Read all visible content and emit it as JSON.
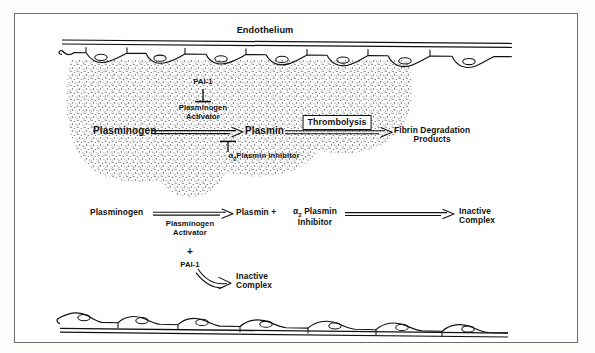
{
  "figure": {
    "domain_title": "Fibrinolysis and thrombolysis schematic",
    "frame_color": "#6d6d6d",
    "ink_color": "#111111",
    "clot_stipple_color": "#2b2b2b"
  },
  "vessel": {
    "top_label": "Endothelium",
    "top_cell_count": 7,
    "bottom_cell_count": 7
  },
  "clot_pathway": {
    "inhibitor_top": "PAI-1",
    "activator_line1": "Plasminogen",
    "activator_line2": "Activator",
    "substrate": "Plasminogen",
    "enzyme": "Plasmin",
    "inhibitor_bottom_alpha": "α",
    "inhibitor_bottom_sub": "2",
    "inhibitor_bottom_text": "Plasmin  Inhibitor",
    "process_box": "Thrombolysis",
    "product_line1": "Fibrin  Degradation",
    "product_line2": "Products"
  },
  "solution_pathway": {
    "substrate": "Plasminogen",
    "activator_line1": "Plasminogen",
    "activator_line2": "Activator",
    "plus_sign": "+",
    "inhibitor": "PAI-1",
    "enzyme_plus": "Plasmin +",
    "inhibitor2_alpha": "α",
    "inhibitor2_sub": "2",
    "inhibitor2_line1": "Plasmin",
    "inhibitor2_line2": "Inhibitor",
    "product1_line1": "Inactive",
    "product1_line2": "Complex",
    "product2_line1": "Inactive",
    "product2_line2": "Complex"
  }
}
